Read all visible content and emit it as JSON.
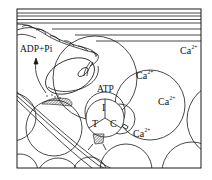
{
  "diagram": {
    "type": "muscle thin filament / myosin head schematic",
    "colors": {
      "line": "#1a1a1a",
      "background": "#ffffff"
    },
    "labels": {
      "adp_pi": "ADP+Pi",
      "atp": "ATP",
      "troponin_i": "I",
      "troponin_t": "T",
      "troponin_c": "C"
    },
    "ions": [
      {
        "id": "ca-top-right",
        "base": "Ca",
        "charge": "2+"
      },
      {
        "id": "ca-upper-middle",
        "base": "Ca",
        "charge": "2+"
      },
      {
        "id": "ca-right-middle",
        "base": "Ca",
        "charge": "2+"
      },
      {
        "id": "ca-bound-troponin-c",
        "base": "Ca",
        "charge": "2+"
      }
    ],
    "components": [
      "thick-filament-lines",
      "myosin-twisted-tail",
      "myosin-head",
      "actin-globules",
      "tropomyosin-strand",
      "troponin-complex",
      "binding-site-hatch"
    ]
  }
}
